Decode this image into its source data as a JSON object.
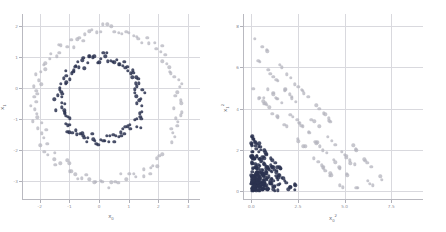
{
  "figure": {
    "background": "#ffffff",
    "grid_color": "#d9d9de",
    "panels": 2
  },
  "chart_data": [
    {
      "type": "scatter",
      "panel": "left",
      "title": "",
      "xlabel": "x0",
      "ylabel": "x1",
      "xlabel_display": "x₀",
      "ylabel_display": "x₁",
      "xlim": [
        -2.6,
        3.4
      ],
      "ylim": [
        -3.6,
        2.4
      ],
      "xticks": [
        -2,
        -1,
        0,
        1,
        2,
        3
      ],
      "yticks": [
        -3,
        -2,
        -1,
        0,
        1,
        2
      ],
      "xticklabels": [
        "-2",
        "-1",
        "0",
        "1",
        "2",
        "3"
      ],
      "yticklabels": [
        "-3",
        "-2",
        "-1",
        "0",
        "1",
        "2"
      ],
      "grid": true,
      "legend": "none",
      "description": "two noisy concentric circles",
      "series": [
        {
          "name": "outer-ring",
          "color": "#b4b4be",
          "marker_size": 1.7,
          "opacity": 0.75,
          "center": [
            0.25,
            -0.55
          ],
          "radius": 2.45,
          "noise": 0.1,
          "count": 120,
          "arc_start_deg": -28,
          "arc_span_deg": 352
        },
        {
          "name": "inner-ring",
          "color": "#2b3350",
          "marker_size": 1.7,
          "opacity": 0.85,
          "center": [
            0.05,
            -0.35
          ],
          "radius": 1.35,
          "noise": 0.09,
          "count": 120,
          "arc_start_deg": -8,
          "arc_span_deg": 355
        }
      ]
    },
    {
      "type": "scatter",
      "panel": "right",
      "title": "",
      "xlabel": "x0^2",
      "ylabel": "x1^2",
      "xlabel_display": "x₀²",
      "ylabel_display": "x₁²",
      "xlim": [
        -0.45,
        9.2
      ],
      "ylim": [
        -0.45,
        8.6
      ],
      "xticks": [
        0.0,
        2.5,
        5.0,
        7.5
      ],
      "yticks": [
        0,
        2,
        4,
        6,
        8
      ],
      "xticklabels": [
        "0.0",
        "2.5",
        "5.0",
        "7.5"
      ],
      "yticklabels": [
        "0",
        "2",
        "4",
        "6",
        "8"
      ],
      "grid": true,
      "legend": "none",
      "description": "squared-feature space; points fall on anti-diagonal bands of constant radius",
      "series": [
        {
          "name": "outer-ring-squared",
          "color": "#b4b4be",
          "marker_size": 1.7,
          "opacity": 0.75,
          "radius_mean": 2.45,
          "noise": 0.1,
          "count": 120,
          "band_sum_range": [
            5.0,
            7.6
          ]
        },
        {
          "name": "inner-ring-squared",
          "color": "#2b3350",
          "marker_size": 1.7,
          "opacity": 0.85,
          "radius_mean": 1.35,
          "noise": 0.09,
          "count": 120,
          "band_sum_range": [
            1.4,
            2.6
          ]
        }
      ]
    }
  ]
}
